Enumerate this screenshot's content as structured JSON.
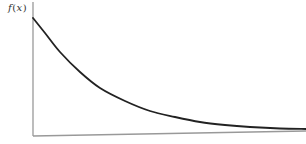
{
  "chart_data": {
    "type": "line",
    "title": "",
    "xlabel": "",
    "ylabel": "f(x)",
    "ylabel_parts": {
      "fn": "f",
      "open": "(",
      "var": "x",
      "close": ")"
    },
    "grid": false,
    "legend": null,
    "series": [
      {
        "name": "f(x)",
        "color": "#222222",
        "points_px": [
          [
            33,
            18
          ],
          [
            45,
            33
          ],
          [
            60,
            52
          ],
          [
            80,
            72
          ],
          [
            100,
            88
          ],
          [
            125,
            101
          ],
          [
            150,
            111
          ],
          [
            175,
            117
          ],
          [
            200,
            122
          ],
          [
            225,
            125
          ],
          [
            250,
            127
          ],
          [
            280,
            128.5
          ],
          [
            306,
            129
          ]
        ]
      }
    ],
    "axes": {
      "color": "#999999",
      "y_axis": {
        "x": 33,
        "top": 2,
        "bottom": 136
      },
      "x_axis": {
        "x1": 33,
        "y1": 136,
        "x2": 306,
        "y2": 131
      }
    },
    "curve_color": "#222222"
  }
}
